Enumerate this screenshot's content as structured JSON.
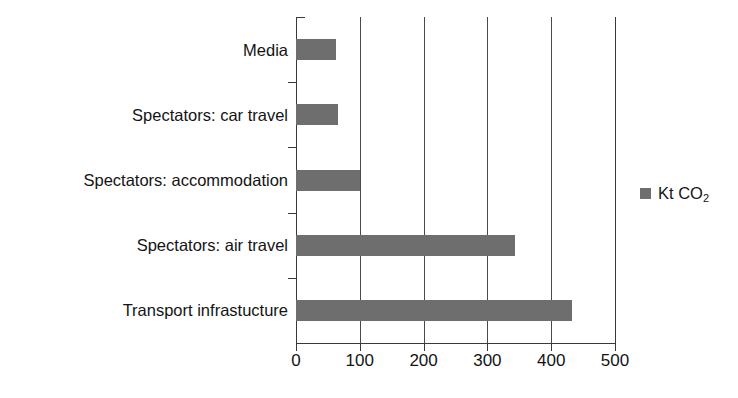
{
  "chart_data": {
    "type": "bar",
    "orientation": "horizontal",
    "title": "",
    "subtitle": "",
    "xlabel": "",
    "ylabel": "",
    "categories": [
      "Media",
      "Spectators: car travel",
      "Spectators: accommodation",
      "Spectators: air travel",
      "Transport infrastucture"
    ],
    "values": [
      63,
      66,
      100,
      343,
      432
    ],
    "series": [
      {
        "name": "Kt CO2",
        "values": [
          63,
          66,
          100,
          343,
          432
        ]
      }
    ],
    "xlim": [
      0,
      500
    ],
    "xticks": [
      0,
      100,
      200,
      300,
      400,
      500
    ],
    "xtick_labels": [
      "0",
      "100",
      "200",
      "300",
      "400",
      "500"
    ],
    "grid": "vertical-major",
    "legend_position": "right",
    "legend_entries": [
      {
        "label_prefix": "Kt CO",
        "label_sub": "2",
        "color": "#6e6e6e"
      }
    ],
    "bar_color": "#6e6e6e",
    "axis_color": "#3a3a3a",
    "background_color": "#ffffff"
  },
  "legend": {
    "text_prefix": "Kt CO",
    "text_sub": "2"
  }
}
